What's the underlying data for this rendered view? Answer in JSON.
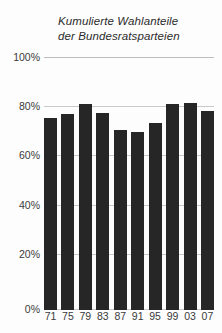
{
  "chart_data": {
    "type": "bar",
    "title": "Kumulierte Wahlanteile der Bundesratsparteien",
    "title_lines": [
      "Kumulierte Wahlanteile",
      "der Bundesratsparteien"
    ],
    "xlabel": "",
    "ylabel": "",
    "categories": [
      "71",
      "75",
      "79",
      "83",
      "87",
      "91",
      "95",
      "99",
      "03",
      "07"
    ],
    "values": [
      76,
      77.5,
      81.5,
      78,
      71,
      70.5,
      74,
      81.5,
      82,
      78.5
    ],
    "ylim": [
      0,
      100
    ],
    "ytick_values": [
      0,
      20,
      40,
      60,
      80,
      100
    ],
    "ytick_labels": [
      "0%",
      "20%",
      "40%",
      "60%",
      "80%",
      "100%"
    ],
    "grid": true,
    "legend": "none",
    "bar_color": "#262626",
    "grid_color": "#c9c9c9",
    "text_color": "#3a3a3a"
  }
}
